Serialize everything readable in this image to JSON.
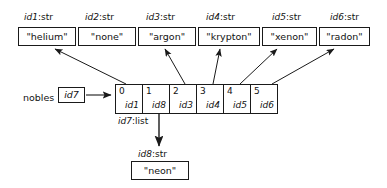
{
  "diagram": {
    "stroke_color": "#1a1a1a",
    "background": "#ffffff",
    "string_objects": [
      {
        "type_label_id": "id1",
        "type_label_kind": ":str",
        "value": "\"helium\""
      },
      {
        "type_label_id": "id2",
        "type_label_kind": ":str",
        "value": "\"none\""
      },
      {
        "type_label_id": "id3",
        "type_label_kind": ":str",
        "value": "\"argon\""
      },
      {
        "type_label_id": "id4",
        "type_label_kind": ":str",
        "value": "\"krypton\""
      },
      {
        "type_label_id": "id5",
        "type_label_kind": ":str",
        "value": "\"xenon\""
      },
      {
        "type_label_id": "id6",
        "type_label_kind": ":str",
        "value": "\"radon\""
      }
    ],
    "variable": {
      "name": "nobles",
      "ref_value": "id7"
    },
    "list_object": {
      "type_label_id": "id7",
      "type_label_kind": ":list",
      "cells": [
        {
          "index": "0",
          "ref": "id1"
        },
        {
          "index": "1",
          "ref": "id8"
        },
        {
          "index": "2",
          "ref": "id3"
        },
        {
          "index": "3",
          "ref": "id4"
        },
        {
          "index": "4",
          "ref": "id5"
        },
        {
          "index": "5",
          "ref": "id6"
        }
      ]
    },
    "orphan_object": {
      "type_label_id": "id8",
      "type_label_kind": ":str",
      "value": "\"neon\""
    }
  }
}
